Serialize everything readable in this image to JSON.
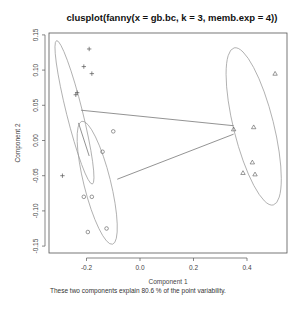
{
  "chart_data": {
    "type": "scatter",
    "title": "clusplot(fanny(x = gb.bc, k = 3, memb.exp = 4))",
    "xlabel": "Component 1",
    "ylabel": "Component 2",
    "subtitle": "These two components explain 80.6 % of the point variability.",
    "xlim": [
      -0.32,
      0.53
    ],
    "ylim": [
      -0.16,
      0.155
    ],
    "xticks": [
      -0.2,
      0.0,
      0.2,
      0.4
    ],
    "xtick_labels": [
      "-0.2",
      "0.0",
      "0.2",
      "0.4"
    ],
    "yticks": [
      -0.15,
      -0.1,
      -0.05,
      0.0,
      0.05,
      0.1,
      0.15
    ],
    "ytick_labels": [
      "-0.15",
      "-0.10",
      "-0.05",
      "0.00",
      "0.05",
      "0.10",
      "0.15"
    ],
    "grid": false,
    "series": [
      {
        "name": "Cluster 1",
        "marker": "+",
        "points": [
          [
            -0.19,
            0.13
          ],
          [
            -0.21,
            0.105
          ],
          [
            -0.18,
            0.095
          ],
          [
            -0.24,
            0.065
          ],
          [
            -0.235,
            0.068
          ],
          [
            -0.29,
            -0.05
          ]
        ],
        "ellipse": {
          "cx": -0.245,
          "cy": 0.04,
          "rx": 0.03,
          "ry": 0.105,
          "angle_deg": -14
        }
      },
      {
        "name": "Cluster 2",
        "marker": "o",
        "points": [
          [
            -0.1,
            0.013
          ],
          [
            -0.14,
            -0.016
          ],
          [
            -0.21,
            -0.08
          ],
          [
            -0.18,
            -0.08
          ],
          [
            -0.195,
            -0.13
          ],
          [
            -0.125,
            -0.125
          ]
        ],
        "ellipse": {
          "cx": -0.16,
          "cy": -0.06,
          "rx": 0.05,
          "ry": 0.09,
          "angle_deg": -14
        }
      },
      {
        "name": "Cluster 3",
        "marker": "triangle",
        "points": [
          [
            0.505,
            0.095
          ],
          [
            0.35,
            0.016
          ],
          [
            0.425,
            0.019
          ],
          [
            0.42,
            -0.031
          ],
          [
            0.385,
            -0.046
          ],
          [
            0.43,
            -0.048
          ]
        ],
        "ellipse": {
          "cx": 0.425,
          "cy": 0.02,
          "rx": 0.075,
          "ry": 0.115,
          "angle_deg": -14
        }
      }
    ],
    "connecting_lines": [
      {
        "from": [
          -0.22,
          0.043
        ],
        "to": [
          0.35,
          0.021
        ]
      },
      {
        "from": [
          -0.085,
          -0.055
        ],
        "to": [
          0.35,
          0.009
        ]
      },
      {
        "from": [
          -0.23,
          0.025
        ],
        "to": [
          -0.19,
          -0.022
        ]
      }
    ]
  },
  "labels": {
    "title": "clusplot(fanny(x = gb.bc, k = 3, memb.exp = 4))",
    "xlabel": "Component 1",
    "ylabel": "Component 2",
    "footnote": "These two components explain 80.6 % of the point variability."
  }
}
